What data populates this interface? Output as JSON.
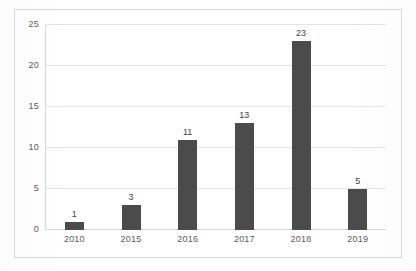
{
  "chart_data": {
    "type": "bar",
    "title": "",
    "subtitle": "",
    "xlabel": "",
    "ylabel": "",
    "categories": [
      "2010",
      "2015",
      "2016",
      "2017",
      "2018",
      "2019"
    ],
    "values": [
      1,
      3,
      11,
      13,
      23,
      5
    ],
    "data_labels": [
      "1",
      "3",
      "11",
      "13",
      "23",
      "5"
    ],
    "ylim": [
      0,
      25
    ],
    "yticks": [
      0,
      5,
      10,
      15,
      20,
      25
    ],
    "ytick_labels": [
      "0",
      "5",
      "10",
      "15",
      "20",
      "25"
    ],
    "grid": "horizontal",
    "legend": "none",
    "bar_color": "#4b4b4b",
    "gridline_color": "#e4e4e4",
    "axis_color": "#d9d9d9",
    "label_color": "#5a5a5a",
    "background_color": "#ffffff"
  }
}
